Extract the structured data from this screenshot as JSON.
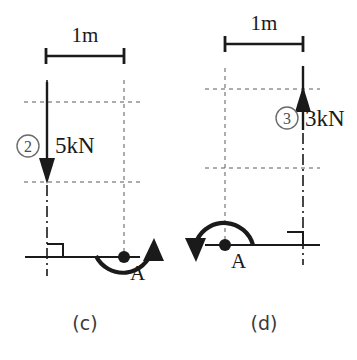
{
  "figure": {
    "background_color": "#ffffff",
    "line_color": "#1a1a1a",
    "grid_color": "#5a5a5a"
  },
  "panels": [
    {
      "id": "c",
      "caption": "(c)",
      "dimension": {
        "label": "1m",
        "value": 1,
        "unit": "m"
      },
      "load": {
        "number_label": "2",
        "magnitude_label": "5kN",
        "value": 5,
        "unit": "kN",
        "direction": "down"
      },
      "node": {
        "label": "A"
      },
      "moment": {
        "direction": "counterclockwise",
        "arc_side": "below",
        "arrow_end": "right-up"
      },
      "support": {
        "type": "fixed-right-angle",
        "side": "right-of-axis"
      }
    },
    {
      "id": "d",
      "caption": "(d)",
      "dimension": {
        "label": "1m",
        "value": 1,
        "unit": "m"
      },
      "load": {
        "number_label": "3",
        "magnitude_label": "3kN",
        "value": 3,
        "unit": "kN",
        "direction": "up"
      },
      "node": {
        "label": "A"
      },
      "moment": {
        "direction": "counterclockwise",
        "arc_side": "above",
        "arrow_end": "left-down"
      },
      "support": {
        "type": "fixed-right-angle",
        "side": "left-of-axis"
      }
    }
  ]
}
